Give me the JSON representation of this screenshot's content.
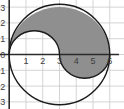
{
  "chart_data": {
    "type": "line",
    "title": "",
    "subtitle": "",
    "xlabel": "",
    "ylabel": "",
    "xlim": [
      -0.55,
      6.85
    ],
    "ylim": [
      -3.45,
      3.45
    ],
    "grid": true,
    "grid_spacing": 1,
    "legend": null,
    "x_ticks": [
      1,
      2,
      3,
      4,
      5,
      6
    ],
    "x_tick_labels": [
      "1",
      "2",
      "3",
      "4",
      "5",
      "6"
    ],
    "y_ticks": [
      3,
      2,
      1,
      0,
      -1,
      -2,
      -3
    ],
    "y_tick_labels": [
      "3",
      "2",
      "1",
      "0",
      "-1",
      "-2",
      "-3"
    ],
    "curves": [
      {
        "name": "outer-circle",
        "shape": "circle",
        "center": [
          3,
          0
        ],
        "radius": 3,
        "stroke": "#1a1a1a",
        "fill": "none"
      },
      {
        "name": "upper-semicircle",
        "shape": "semicircle",
        "center": [
          1.5,
          0
        ],
        "radius": 1.5,
        "half": "upper",
        "stroke": "#1a1a1a"
      },
      {
        "name": "lower-semicircle",
        "shape": "semicircle",
        "center": [
          4.5,
          0
        ],
        "radius": 1.5,
        "half": "lower",
        "stroke": "#1a1a1a"
      }
    ],
    "shaded_regions": [
      {
        "name": "yin-yang-shaded-half",
        "description": "S-shaped half of the disk bounded by the outer circle of radius 3 centered at (3,0) and the S-curve made of the upper semicircle centered at (1.5,0) and the lower semicircle centered at (4.5,0)",
        "fill": "#8f8f8f",
        "stroke": "#1a1a1a"
      }
    ],
    "unshaded_regions": [
      {
        "name": "yin-yang-white-half",
        "fill": "#ffffff"
      }
    ],
    "series": [
      {
        "name": "outer-circle-upper",
        "x": [
          0,
          1.5,
          3,
          4.5,
          6
        ],
        "y": [
          0,
          2.598,
          3,
          2.598,
          0
        ]
      },
      {
        "name": "outer-circle-lower",
        "x": [
          0,
          1.5,
          3,
          4.5,
          6
        ],
        "y": [
          0,
          -2.598,
          -3,
          -2.598,
          0
        ]
      },
      {
        "name": "s-curve",
        "x": [
          0,
          0.75,
          1.5,
          2.25,
          3,
          3.75,
          4.5,
          5.25,
          6
        ],
        "y": [
          0,
          1.299,
          1.5,
          1.299,
          0,
          -1.299,
          -1.5,
          -1.299,
          0
        ]
      }
    ]
  },
  "colors": {
    "axis": "#2b2b2b",
    "grid": "#c9c9c9",
    "curve": "#1a1a1a",
    "shade": "#8f8f8f",
    "tick_text": "#3d3d3d",
    "background": "#ffffff"
  },
  "axes": {
    "x_axis_name": "x-axis",
    "y_axis_name": "y-axis"
  }
}
